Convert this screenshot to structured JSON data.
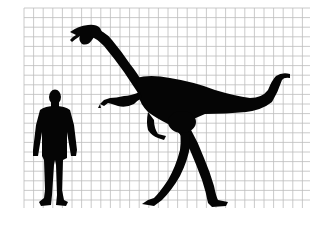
{
  "figure": {
    "kind": "size-comparison",
    "background_color": "#ffffff",
    "grid": {
      "color": "#bdbdbd",
      "x_start": 24,
      "x_end": 310,
      "y_start": 8,
      "y_end": 208,
      "spacing_px": 9.6
    },
    "subjects": [
      {
        "name": "human",
        "icon": "human-silhouette-icon",
        "color": "#050505"
      },
      {
        "name": "dinosaur",
        "icon": "theropod-silhouette-icon",
        "color": "#050505"
      }
    ]
  }
}
